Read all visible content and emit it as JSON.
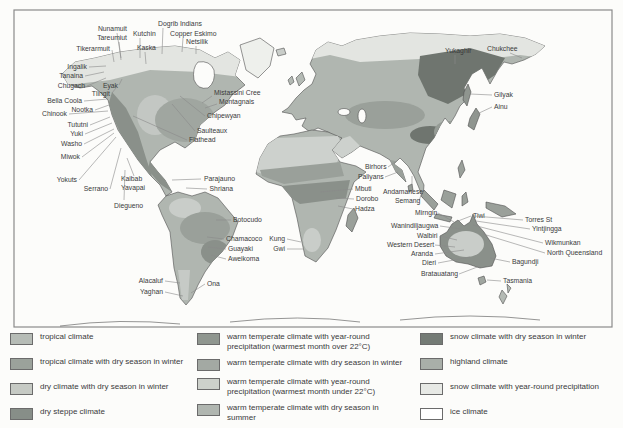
{
  "map": {
    "title": "world map of hunter-gatherer peoples and climate zones",
    "labels": [
      {
        "text": "Nunamuit",
        "x": 127,
        "y": 31,
        "anchor": "end",
        "line": [
          117,
          33,
          121,
          58
        ]
      },
      {
        "text": "Tareumiut",
        "x": 127,
        "y": 40,
        "anchor": "end",
        "line": [
          119,
          42,
          121,
          60
        ]
      },
      {
        "text": "Tikerarmuit",
        "x": 110,
        "y": 51,
        "anchor": "end",
        "line": [
          112,
          50,
          114,
          62
        ]
      },
      {
        "text": "Dogrib Indians",
        "x": 158,
        "y": 26,
        "anchor": "start",
        "line": [
          163,
          28,
          162,
          54
        ]
      },
      {
        "text": "Kutchin",
        "x": 133,
        "y": 36,
        "anchor": "start",
        "line": [
          140,
          38,
          140,
          58
        ]
      },
      {
        "text": "Copper Eskimo",
        "x": 170,
        "y": 36,
        "anchor": "start",
        "line": [
          183,
          38,
          182,
          52
        ]
      },
      {
        "text": "Netsilik",
        "x": 186,
        "y": 44,
        "anchor": "start",
        "line": [
          196,
          46,
          196,
          54
        ]
      },
      {
        "text": "Kaska",
        "x": 137,
        "y": 50,
        "anchor": "start",
        "line": [
          145,
          52,
          146,
          64
        ]
      },
      {
        "text": "Ingalik",
        "x": 87,
        "y": 69,
        "anchor": "end",
        "line": [
          89,
          67,
          106,
          66
        ]
      },
      {
        "text": "Tanaina",
        "x": 83,
        "y": 78,
        "anchor": "end",
        "line": [
          85,
          76,
          104,
          72
        ]
      },
      {
        "text": "Chugach",
        "x": 85,
        "y": 88,
        "anchor": "end",
        "line": [
          87,
          86,
          106,
          78
        ]
      },
      {
        "text": "Eyak",
        "x": 118,
        "y": 88,
        "anchor": "end",
        "line": [
          119,
          85,
          122,
          79
        ]
      },
      {
        "text": "Tlingit",
        "x": 110,
        "y": 96,
        "anchor": "end",
        "line": [
          112,
          93,
          116,
          88
        ]
      },
      {
        "text": "Bella Coola",
        "x": 82,
        "y": 103,
        "anchor": "end",
        "line": [
          84,
          101,
          108,
          99
        ]
      },
      {
        "text": "Nootka",
        "x": 93,
        "y": 112,
        "anchor": "end",
        "line": [
          95,
          110,
          109,
          105
        ]
      },
      {
        "text": "Chinook",
        "x": 67,
        "y": 116,
        "anchor": "end",
        "line": [
          69,
          114,
          108,
          111
        ]
      },
      {
        "text": "Tututni",
        "x": 88,
        "y": 127,
        "anchor": "end",
        "line": [
          90,
          125,
          110,
          117
        ]
      },
      {
        "text": "Yuki",
        "x": 83,
        "y": 136,
        "anchor": "end",
        "line": [
          85,
          134,
          112,
          123
        ]
      },
      {
        "text": "Washo",
        "x": 82,
        "y": 146,
        "anchor": "end",
        "line": [
          84,
          144,
          114,
          129
        ]
      },
      {
        "text": "Miwok",
        "x": 80,
        "y": 159,
        "anchor": "end",
        "line": [
          82,
          157,
          114,
          133
        ]
      },
      {
        "text": "Yokuts",
        "x": 77,
        "y": 182,
        "anchor": "end",
        "line": [
          79,
          180,
          116,
          137
        ]
      },
      {
        "text": "Serrano",
        "x": 108,
        "y": 191,
        "anchor": "end",
        "line": [
          110,
          189,
          121,
          148
        ]
      },
      {
        "text": "Kaibab",
        "x": 121,
        "y": 181,
        "anchor": "start",
        "line": [
          134,
          176,
          127,
          158
        ]
      },
      {
        "text": "Yavapai",
        "x": 121,
        "y": 190,
        "anchor": "start",
        "line": null
      },
      {
        "text": "Diegueno",
        "x": 114,
        "y": 208,
        "anchor": "start",
        "line": [
          124,
          200,
          125,
          170
        ]
      },
      {
        "text": "Mistassini Cree",
        "x": 214,
        "y": 95,
        "anchor": "start",
        "line": [
          212,
          96,
          202,
          103
        ]
      },
      {
        "text": "Montagnais",
        "x": 219,
        "y": 104,
        "anchor": "start",
        "line": [
          217,
          104,
          205,
          108
        ]
      },
      {
        "text": "Chipewyan",
        "x": 207,
        "y": 118,
        "anchor": "start",
        "line": [
          205,
          116,
          180,
          96
        ]
      },
      {
        "text": "Saulteaux",
        "x": 197,
        "y": 133,
        "anchor": "start",
        "line": [
          195,
          131,
          172,
          104
        ]
      },
      {
        "text": "Flathead",
        "x": 189,
        "y": 142,
        "anchor": "start",
        "line": [
          187,
          140,
          133,
          116
        ]
      },
      {
        "text": "Parajauno",
        "x": 235,
        "y": 181,
        "anchor": "end",
        "line": [
          201,
          179,
          172,
          180
        ]
      },
      {
        "text": "Shriana",
        "x": 233,
        "y": 191,
        "anchor": "end",
        "line": [
          207,
          189,
          186,
          188
        ]
      },
      {
        "text": "Botocudo",
        "x": 233,
        "y": 222,
        "anchor": "start",
        "line": [
          231,
          220,
          216,
          220
        ]
      },
      {
        "text": "Chamacoco",
        "x": 226,
        "y": 241,
        "anchor": "start",
        "line": [
          224,
          239,
          207,
          237
        ]
      },
      {
        "text": "Guayaki",
        "x": 228,
        "y": 251,
        "anchor": "start",
        "line": [
          226,
          249,
          208,
          247
        ]
      },
      {
        "text": "Aweikoma",
        "x": 228,
        "y": 261,
        "anchor": "start",
        "line": [
          226,
          259,
          211,
          255
        ]
      },
      {
        "text": "Alacaluf",
        "x": 163,
        "y": 283,
        "anchor": "end",
        "line": [
          165,
          281,
          180,
          283
        ]
      },
      {
        "text": "Yaghan",
        "x": 163,
        "y": 294,
        "anchor": "end",
        "line": [
          165,
          292,
          183,
          296
        ]
      },
      {
        "text": "Ona",
        "x": 207,
        "y": 286,
        "anchor": "start",
        "line": [
          205,
          284,
          191,
          293
        ]
      },
      {
        "text": "Kung",
        "x": 285,
        "y": 241,
        "anchor": "end",
        "line": [
          287,
          239,
          301,
          242
        ]
      },
      {
        "text": "Gwi",
        "x": 285,
        "y": 251,
        "anchor": "end",
        "line": [
          287,
          249,
          303,
          249
        ]
      },
      {
        "text": "Mbuti",
        "x": 355,
        "y": 191,
        "anchor": "start",
        "line": [
          353,
          189,
          320,
          192
        ]
      },
      {
        "text": "Dorobo",
        "x": 356,
        "y": 201,
        "anchor": "start",
        "line": [
          354,
          199,
          336,
          198
        ]
      },
      {
        "text": "Hadza",
        "x": 355,
        "y": 211,
        "anchor": "start",
        "line": [
          353,
          209,
          338,
          206
        ]
      },
      {
        "text": "Birhors",
        "x": 365,
        "y": 169,
        "anchor": "start",
        "line": [
          388,
          167,
          398,
          160
        ]
      },
      {
        "text": "Paliyans",
        "x": 358,
        "y": 179,
        "anchor": "start",
        "line": [
          385,
          177,
          398,
          172
        ]
      },
      {
        "text": "Andamanese",
        "x": 383,
        "y": 194,
        "anchor": "start",
        "line": [
          412,
          188,
          412,
          176
        ]
      },
      {
        "text": "Semang",
        "x": 395,
        "y": 203,
        "anchor": "start",
        "line": [
          419,
          201,
          422,
          192
        ]
      },
      {
        "text": "Yukaghir",
        "x": 445,
        "y": 53,
        "anchor": "start",
        "line": [
          455,
          55,
          455,
          64
        ]
      },
      {
        "text": "Chukchee",
        "x": 487,
        "y": 51,
        "anchor": "start",
        "line": [
          510,
          53,
          522,
          58
        ]
      },
      {
        "text": "Gilyak",
        "x": 494,
        "y": 97,
        "anchor": "start",
        "line": [
          492,
          95,
          470,
          94
        ]
      },
      {
        "text": "Ainu",
        "x": 494,
        "y": 109,
        "anchor": "start",
        "line": [
          492,
          107,
          477,
          114
        ]
      },
      {
        "text": "Mirngin",
        "x": 415,
        "y": 215,
        "anchor": "start",
        "line": [
          438,
          213,
          454,
          222
        ]
      },
      {
        "text": "Wanindiljaugwa",
        "x": 391,
        "y": 228,
        "anchor": "start",
        "line": [
          440,
          226,
          461,
          229
        ]
      },
      {
        "text": "Tiwi",
        "x": 473,
        "y": 218,
        "anchor": "start",
        "line": [
          471,
          216,
          458,
          221
        ]
      },
      {
        "text": "Torres St",
        "x": 525,
        "y": 222,
        "anchor": "start",
        "line": [
          523,
          220,
          474,
          216
        ]
      },
      {
        "text": "Yintjingga",
        "x": 532,
        "y": 231,
        "anchor": "start",
        "line": [
          530,
          229,
          476,
          221
        ]
      },
      {
        "text": "Wikmunkan",
        "x": 545,
        "y": 245,
        "anchor": "start",
        "line": [
          543,
          243,
          473,
          225
        ]
      },
      {
        "text": "North Queensland",
        "x": 547,
        "y": 255,
        "anchor": "start",
        "line": [
          545,
          253,
          483,
          234
        ]
      },
      {
        "text": "Walbiri",
        "x": 417,
        "y": 238,
        "anchor": "start",
        "line": [
          440,
          236,
          457,
          240
        ]
      },
      {
        "text": "Western Desert",
        "x": 387,
        "y": 247,
        "anchor": "start",
        "line": [
          435,
          245,
          455,
          247
        ]
      },
      {
        "text": "Aranda",
        "x": 411,
        "y": 256,
        "anchor": "start",
        "line": [
          435,
          254,
          464,
          250
        ]
      },
      {
        "text": "Dieri",
        "x": 422,
        "y": 265,
        "anchor": "start",
        "line": [
          438,
          263,
          470,
          257
        ]
      },
      {
        "text": "Bagundji",
        "x": 512,
        "y": 264,
        "anchor": "start",
        "line": [
          510,
          262,
          490,
          258
        ]
      },
      {
        "text": "Bratauatang",
        "x": 421,
        "y": 276,
        "anchor": "start",
        "line": [
          459,
          274,
          480,
          266
        ]
      },
      {
        "text": "Tasmania",
        "x": 503,
        "y": 283,
        "anchor": "start",
        "line": [
          501,
          281,
          487,
          280
        ]
      }
    ]
  },
  "legend": {
    "columns": [
      {
        "items": [
          {
            "label": "tropical climate",
            "color": "#b6bcb6"
          },
          {
            "label": "tropical climate with dry season in winter",
            "color": "#9ba29b"
          },
          {
            "label": "dry climate with dry season in winter",
            "color": "#c6cac4"
          },
          {
            "label": "dry steppe climate",
            "color": "#878e88"
          }
        ]
      },
      {
        "items": [
          {
            "label": "warm temperate climate with year-round precipitation (warmest month over 22°C)",
            "color": "#8f968f"
          },
          {
            "label": "warm temperate climate with dry season in winter",
            "color": "#a3a9a3"
          },
          {
            "label": "warm temperate climate with year-round precipitation (warmest month under 22°C)",
            "color": "#cdd1cb"
          },
          {
            "label": "warm temperate climate with dry season in summer",
            "color": "#b0b6b0"
          }
        ]
      },
      {
        "items": [
          {
            "label": "snow climate with dry season in winter",
            "color": "#747b75"
          },
          {
            "label": "highland climate",
            "color": "#a9afa9"
          },
          {
            "label": "snow climate with year-round precipitation",
            "color": "#e7e9e5"
          },
          {
            "label": "ice climate",
            "color": "#ffffff"
          }
        ]
      }
    ]
  },
  "colors": {
    "land_base": "#b0b6b0",
    "coastline": "#4f4f4f",
    "ocean": "#fcfcfa",
    "frame": "#8a8a8a"
  }
}
